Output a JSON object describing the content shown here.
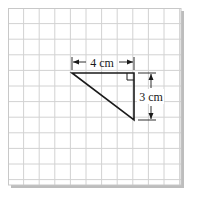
{
  "diagram": {
    "type": "right-triangle-on-grid",
    "grid": {
      "columns": 11,
      "rows": 11,
      "cell_size_px": 15.6
    },
    "triangle": {
      "vertices_grid": [
        [
          4,
          4
        ],
        [
          8,
          4
        ],
        [
          8,
          7
        ]
      ],
      "right_angle_at": [
        8,
        4
      ]
    },
    "labels": {
      "width": "4 cm",
      "height": "3 cm"
    },
    "colors": {
      "grid_line": "#d4d4d4",
      "paper": "#ffffff",
      "shadow": "#b8b8b8",
      "ink": "#1a1a1a"
    }
  }
}
